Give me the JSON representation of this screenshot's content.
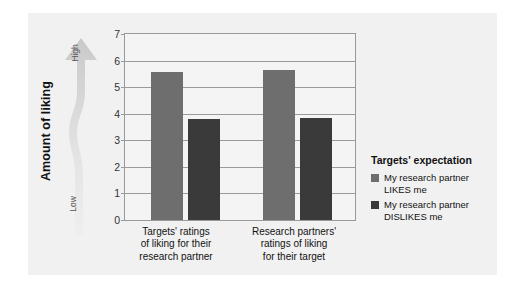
{
  "chart_data": {
    "type": "bar",
    "title": "",
    "xlabel": "",
    "ylabel": "Amount of liking",
    "ylim": [
      0,
      7
    ],
    "yticks": [
      "0",
      "1",
      "2",
      "3",
      "4",
      "5",
      "6",
      "7"
    ],
    "grid": true,
    "legend_position": "right",
    "categories": [
      "Targets' ratings of liking for their research partner",
      "Research partners' ratings of liking for their target"
    ],
    "series": [
      {
        "name": "My research partner LIKES me",
        "color": "#6e6e6e",
        "values": [
          5.58,
          5.65
        ]
      },
      {
        "name": "My research partner DISLIKES me",
        "color": "#3a3a3a",
        "values": [
          3.79,
          3.83
        ]
      }
    ],
    "annotations": {
      "axis_arrow_high": "High",
      "axis_arrow_low": "Low"
    }
  },
  "axis": {
    "y_title": "Amount of liking",
    "arrow_high": "High",
    "arrow_low": "Low",
    "ticks": [
      "7",
      "6",
      "5",
      "4",
      "3",
      "2",
      "1",
      "0"
    ]
  },
  "xaxis": {
    "labels": [
      {
        "line1": "Targets' ratings",
        "line2": "of liking for their",
        "line3": "research partner"
      },
      {
        "line1": "Research partners'",
        "line2": "ratings of liking",
        "line3": "for their target"
      }
    ]
  },
  "legend": {
    "title": "Targets' expectation",
    "items": [
      {
        "label_line1": "My research partner",
        "label_line2": "LIKES me",
        "color": "#6e6e6e"
      },
      {
        "label_line1": "My research partner",
        "label_line2": "DISLIKES me",
        "color": "#3a3a3a"
      }
    ]
  },
  "colors": {
    "panel": "#f1f1f1",
    "plot_bg": "#f4f4f4",
    "axis": "#9a9a9a",
    "series_light": "#6e6e6e",
    "series_dark": "#3a3a3a",
    "arrow": "#d9d9d9"
  }
}
